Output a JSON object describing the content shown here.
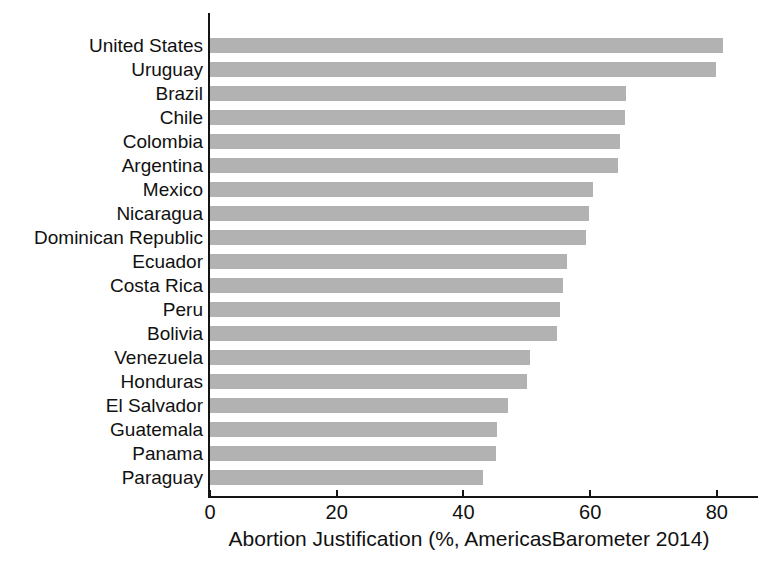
{
  "chart_data": {
    "type": "bar",
    "orientation": "horizontal",
    "title": "",
    "xlabel": "Abortion Justification (%, AmericasBarometer 2014)",
    "ylabel": "",
    "xlim": [
      0,
      85
    ],
    "xticks": [
      0,
      20,
      40,
      60,
      80
    ],
    "xtick_labels": [
      "0",
      "20",
      "40",
      "60",
      "80"
    ],
    "grid": false,
    "legend": null,
    "bar_color": "#b2b2b2",
    "axis_color": "#141414",
    "categories": [
      "United States",
      "Uruguay",
      "Brazil",
      "Chile",
      "Colombia",
      "Argentina",
      "Mexico",
      "Nicaragua",
      "Dominican Republic",
      "Ecuador",
      "Costa Rica",
      "Peru",
      "Bolivia",
      "Venezuela",
      "Honduras",
      "El Salvador",
      "Guatemala",
      "Panama",
      "Paraguay"
    ],
    "values": [
      80.9,
      79.8,
      65.7,
      65.5,
      64.7,
      64.4,
      60.4,
      59.8,
      59.3,
      56.3,
      55.7,
      55.3,
      54.8,
      50.5,
      50.1,
      47.0,
      45.3,
      45.2,
      43.1
    ]
  }
}
